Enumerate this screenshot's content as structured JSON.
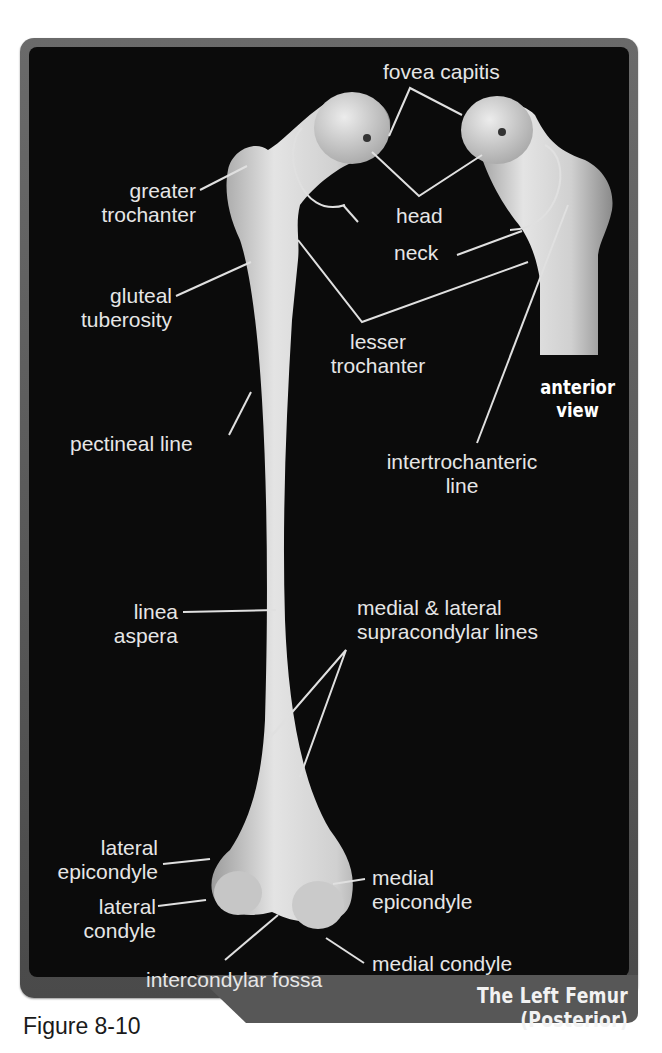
{
  "figure": {
    "number_label": "Figure 8-10",
    "title": "The Left Femur (Posterior)",
    "inset_view_label": [
      "anterior",
      "view"
    ]
  },
  "colors": {
    "panel_background": "#0b0b0b",
    "frame": "#575757",
    "label_text": "#e6e6e6",
    "bone": "#d8d8d8"
  },
  "labels": {
    "fovea_capitis": "fovea capitis",
    "head": "head",
    "neck": "neck",
    "greater_trochanter": [
      "greater",
      "trochanter"
    ],
    "gluteal_tuberosity": [
      "gluteal",
      "tuberosity"
    ],
    "lesser_trochanter": [
      "lesser",
      "trochanter"
    ],
    "pectineal_line": "pectineal line",
    "intertrochanteric_line": [
      "intertrochanteric",
      "line"
    ],
    "linea_aspera": [
      "linea",
      "aspera"
    ],
    "supracondylar_lines": [
      "medial & lateral",
      "supracondylar lines"
    ],
    "lateral_epicondyle": [
      "lateral",
      "epicondyle"
    ],
    "lateral_condyle": [
      "lateral",
      "condyle"
    ],
    "medial_epicondyle": [
      "medial",
      "epicondyle"
    ],
    "medial_condyle": "medial condyle",
    "intercondylar_fossa": "intercondylar fossa"
  }
}
